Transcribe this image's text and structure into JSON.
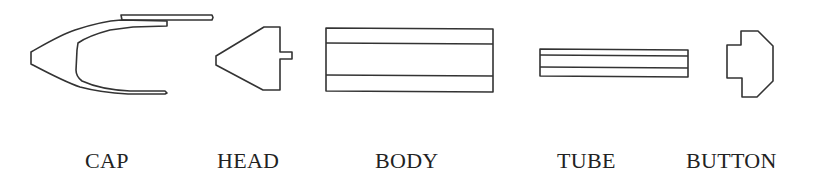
{
  "diagram": {
    "type": "exploded-parts",
    "stroke_color": "#333333",
    "background": "#ffffff",
    "parts": [
      {
        "id": "cap",
        "label": "CAP"
      },
      {
        "id": "head",
        "label": "HEAD"
      },
      {
        "id": "body",
        "label": "BODY"
      },
      {
        "id": "tube",
        "label": "TUBE"
      },
      {
        "id": "button",
        "label": "BUTTON"
      }
    ]
  }
}
